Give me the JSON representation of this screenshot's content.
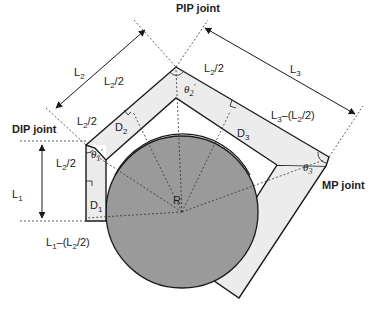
{
  "figure": {
    "joints": {
      "pip": "PIP joint",
      "dip": "DIP joint",
      "mp": "MP joint"
    },
    "lengths": {
      "l1": "L",
      "l1_sub": "1",
      "l2": "L",
      "l2_sub": "2",
      "l3": "L",
      "l3_sub": "3"
    },
    "half_segments": {
      "l2_half_top": {
        "base": "L",
        "sub": "2",
        "tail": "/2"
      },
      "l2_half_mid": {
        "base": "L",
        "sub": "2",
        "tail": "/2"
      },
      "l2_half_pip_right": {
        "base": "L",
        "sub": "2",
        "tail": "/2"
      },
      "l2_half_left": {
        "base": "L",
        "sub": "2",
        "tail": "/2"
      }
    },
    "composite_labels": {
      "l3_minus": {
        "a": "L",
        "a_sub": "3",
        "mid": "–(L",
        "b_sub": "2",
        "tail": "/2)"
      },
      "l1_minus": {
        "a": "L",
        "a_sub": "1",
        "mid": "–(L",
        "b_sub": "2",
        "tail": "/2)"
      }
    },
    "distances": {
      "d1": {
        "base": "D",
        "sub": "1"
      },
      "d2": {
        "base": "D",
        "sub": "2"
      },
      "d3": {
        "base": "D",
        "sub": "3"
      }
    },
    "angles": {
      "theta1": {
        "base": "θ",
        "sub": "1",
        "prime": "'"
      },
      "theta2": {
        "base": "θ",
        "sub": "2",
        "prime": "'"
      },
      "theta3": {
        "base": "θ",
        "sub": "3",
        "prime": ""
      }
    },
    "radius_label": "R",
    "colors": {
      "circle_fill": "#9a9a9a",
      "segment_fill": "#ececec",
      "stroke": "#1a1a1a"
    }
  }
}
